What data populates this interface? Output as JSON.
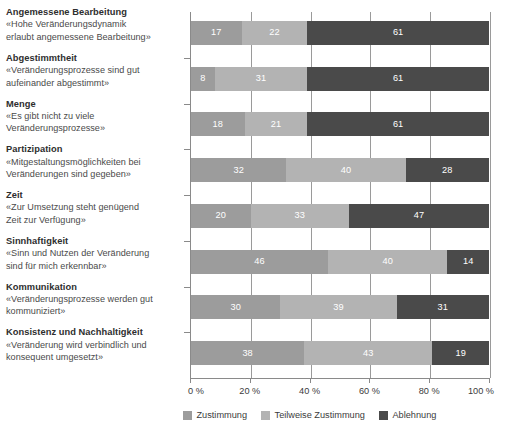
{
  "chart_data": {
    "type": "bar",
    "orientation": "horizontal",
    "stacked": true,
    "stack_total": 100,
    "title": "",
    "subtitle": "",
    "xlabel": "",
    "ylabel": "",
    "xlim": [
      0,
      100
    ],
    "xticks": [
      0,
      20,
      40,
      60,
      80,
      100
    ],
    "xtick_labels": [
      "0 %",
      "20 %",
      "40 %",
      "60 %",
      "80 %",
      "100 %"
    ],
    "grid": true,
    "grid_axis": "x",
    "legend_position": "bottom",
    "legend": [
      "Zustimmung",
      "Teilweise Zustimmung",
      "Ablehnung"
    ],
    "series": [
      {
        "name": "Zustimmung",
        "color": "#9c9c9c",
        "values": [
          17,
          8,
          18,
          32,
          20,
          46,
          30,
          38
        ]
      },
      {
        "name": "Teilweise Zustimmung",
        "color": "#b3b3b3",
        "values": [
          22,
          31,
          21,
          40,
          33,
          40,
          39,
          43
        ]
      },
      {
        "name": "Ablehnung",
        "color": "#4a4a4a",
        "values": [
          61,
          61,
          61,
          28,
          47,
          14,
          31,
          19
        ]
      }
    ],
    "categories": [
      {
        "title": "Angemessene Bearbeitung",
        "quote": "«Hohe Veränderungsdynamik erlaubt angemessene Bearbeitung»",
        "quote_line1": "«Hohe Veränderungsdynamik",
        "quote_line2": "erlaubt angemessene Bearbeitung»"
      },
      {
        "title": "Abgestimmtheit",
        "quote": "«Veränderungsprozesse sind gut aufeinander abgestimmt»",
        "quote_line1": "«Veränderungsprozesse sind gut",
        "quote_line2": "aufeinander abgestimmt»"
      },
      {
        "title": "Menge",
        "quote": "«Es gibt nicht zu viele Veränderungsprozesse»",
        "quote_line1": "«Es gibt nicht zu viele",
        "quote_line2": "Veränderungsprozesse»"
      },
      {
        "title": "Partizipation",
        "quote": "«Mitgestaltungsmöglichkeiten bei Veränderungen sind gegeben»",
        "quote_line1": "«Mitgestaltungsmöglichkeiten bei",
        "quote_line2": "Veränderungen sind gegeben»"
      },
      {
        "title": "Zeit",
        "quote": "«Zur Umsetzung steht genügend Zeit zur Verfügung»",
        "quote_line1": "«Zur Umsetzung steht genügend",
        "quote_line2": "Zeit zur Verfügung»"
      },
      {
        "title": "Sinnhaftigkeit",
        "quote": "«Sinn und Nutzen der Veränderung sind für mich erkennbar»",
        "quote_line1": "«Sinn und Nutzen der Veränderung",
        "quote_line2": "sind für mich erkennbar»"
      },
      {
        "title": "Kommunikation",
        "quote": "«Veränderungsprozesse werden gut kommuniziert»",
        "quote_line1": "«Veränderungsprozesse werden gut",
        "quote_line2": "kommuniziert»"
      },
      {
        "title": "Konsistenz und Nachhaltigkeit",
        "quote": "«Veränderung wird verbindlich und konsequent umgesetzt»",
        "quote_line1": "«Veränderung wird verbindlich und",
        "quote_line2": "konsequent umgesetzt»"
      }
    ]
  },
  "colors": {
    "zustimmung": "#9c9c9c",
    "teilweise_zustimmung": "#b3b3b3",
    "ablehnung": "#4a4a4a",
    "axis": "#8a8a8a",
    "grid": "#9a9a9a",
    "text": "#3b3b3b",
    "value_text": "#ffffff"
  }
}
